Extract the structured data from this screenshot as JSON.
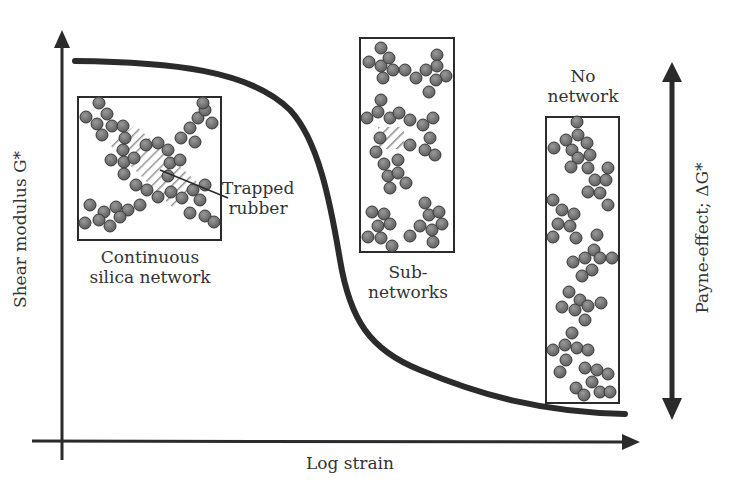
{
  "diagram": {
    "y_axis_label": "Shear modulus G*",
    "x_axis_label": "Log strain",
    "right_arrow_label": "Payne-effect; ΔG*",
    "panels": [
      {
        "id": "continuous",
        "caption_line1": "Continuous",
        "caption_line2": "silica network"
      },
      {
        "id": "sub",
        "caption_line1": "Sub-",
        "caption_line2": "networks"
      },
      {
        "id": "none",
        "caption_line1": "No",
        "caption_line2": "network"
      }
    ],
    "callout": {
      "line1": "Trapped",
      "line2": "rubber"
    },
    "colors": {
      "line": "#2b2b2b",
      "particle_fill": "#7a7a7a",
      "particle_stroke": "#3a3a3a",
      "hatch": "#888888"
    }
  }
}
